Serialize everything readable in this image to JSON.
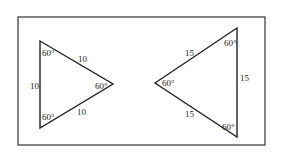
{
  "diagram": {
    "frame": {
      "stroke": "#333333"
    },
    "triangle_left": {
      "angles": [
        "60°",
        "60°",
        "60°"
      ],
      "sides": [
        "10",
        "10",
        "10"
      ]
    },
    "triangle_right": {
      "angles": [
        "60°",
        "60°",
        "60°"
      ],
      "sides": [
        "15",
        "15",
        "15"
      ]
    }
  }
}
